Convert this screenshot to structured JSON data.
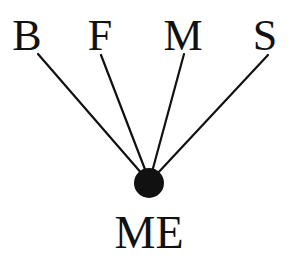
{
  "diagram": {
    "top_nodes": [
      {
        "label": "B",
        "x": 27,
        "line_start": [
          38,
          54
        ]
      },
      {
        "label": "F",
        "x": 100,
        "line_start": [
          101,
          55
        ]
      },
      {
        "label": "M",
        "x": 183,
        "line_start": [
          184,
          54
        ]
      },
      {
        "label": "S",
        "x": 265,
        "line_start": [
          268,
          55
        ]
      }
    ],
    "center_node": {
      "label": "ME",
      "cx": 149,
      "cy": 183,
      "r": 15
    },
    "colors": {
      "ink": "#111111",
      "background": "#ffffff"
    }
  }
}
